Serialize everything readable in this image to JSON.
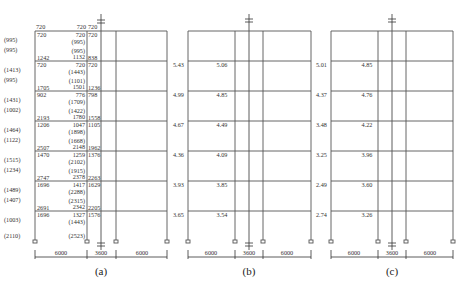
{
  "frames": {
    "a": {
      "caption": "(a)",
      "top_labels": [
        "720",
        "720",
        "720"
      ],
      "left_labels": [
        "(995)",
        "(995)",
        "(1413)",
        "(995)",
        "(1431)",
        "(1002)",
        "(1464)",
        "(1122)",
        "(1515)",
        "(1234)",
        "(1489)",
        "(1407)",
        "(1003)",
        "(2110)"
      ],
      "floors": [
        {
          "tl": "720",
          "tm": "720",
          "tm2": "(995)",
          "tr": "720",
          "bm2": "(995)",
          "bl": "1242",
          "bm": "1132",
          "br": "838"
        },
        {
          "tl": "720",
          "tm": "720",
          "tm2": "(1443)",
          "tr": "720",
          "bm2": "(1101)",
          "bl": "1705",
          "bm": "1501",
          "br": "1236"
        },
        {
          "tl": "902",
          "tm": "776",
          "tm2": "(1709)",
          "tr": "798",
          "bm2": "(1422)",
          "bl": "2193",
          "bm": "1780",
          "br": "1558"
        },
        {
          "tl": "1206",
          "tm": "1047",
          "tm2": "(1898)",
          "tr": "1105",
          "bm2": "(1668)",
          "bl": "2507",
          "bm": "2148",
          "br": "1962"
        },
        {
          "tl": "1470",
          "tm": "1259",
          "tm2": "(2102)",
          "tr": "1376",
          "bm2": "(1915)",
          "bl": "2747",
          "bm": "2378",
          "br": "2263"
        },
        {
          "tl": "1696",
          "tm": "1417",
          "tm2": "(2288)",
          "tr": "1629",
          "bm2": "(2315)",
          "bl": "2691",
          "bm": "2342",
          "br": "2205"
        },
        {
          "tl": "1696",
          "tm": "1327",
          "tm2": "(1443)",
          "tr": "1576",
          "bm2": "(2523)",
          "bl": "",
          "bm": "",
          "br": ""
        }
      ],
      "spans": [
        "6000",
        "3600",
        "6000"
      ]
    },
    "b": {
      "caption": "(b)",
      "left_values": [
        "5.43",
        "4.99",
        "4.67",
        "4.36",
        "3.93",
        "3.65"
      ],
      "inner_values": [
        "5.06",
        "4.85",
        "4.49",
        "4.09",
        "3.85",
        "3.54"
      ],
      "spans": [
        "6000",
        "3600",
        "6000"
      ]
    },
    "c": {
      "caption": "(c)",
      "left_values": [
        "5.01",
        "4.37",
        "3.48",
        "3.25",
        "2.49",
        "2.74"
      ],
      "inner_values": [
        "4.85",
        "4.76",
        "4.22",
        "3.96",
        "3.60",
        "3.26"
      ],
      "spans": [
        "6000",
        "3600",
        "6000"
      ]
    }
  }
}
